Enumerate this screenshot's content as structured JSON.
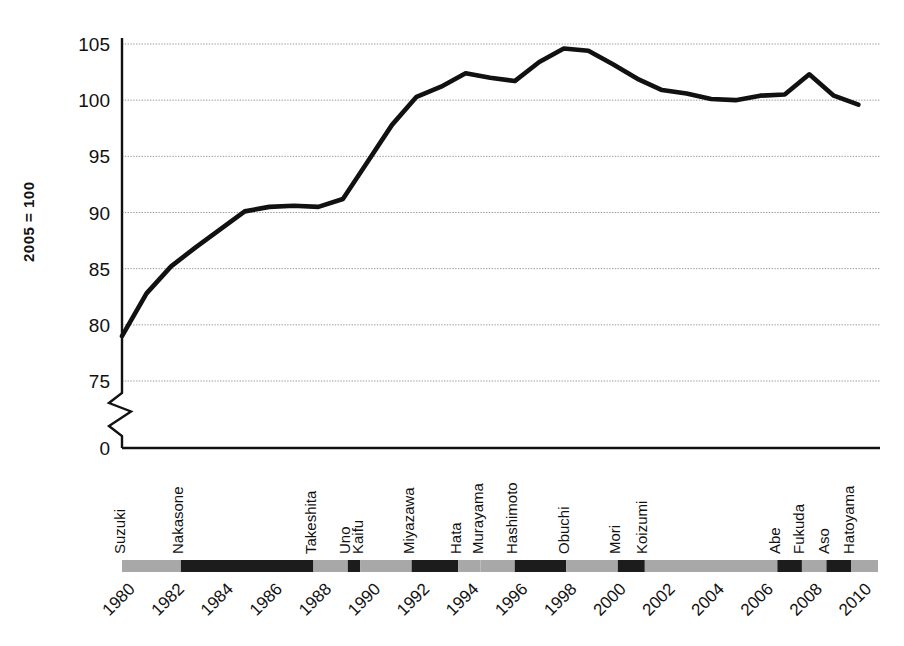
{
  "chart_data": {
    "type": "line",
    "title": "",
    "subtitle": "",
    "xlabel": "",
    "ylabel": "2005 = 100",
    "ylim": [
      75,
      105
    ],
    "y_axis_break": true,
    "y_axis_break_labels": [
      "0",
      "75"
    ],
    "grid": true,
    "legend": "none",
    "yticks": [
      0,
      75,
      80,
      85,
      90,
      95,
      100,
      105
    ],
    "ytick_labels": [
      "0",
      "75",
      "80",
      "85",
      "90",
      "95",
      "100",
      "105"
    ],
    "xticks": [
      1980,
      1982,
      1984,
      1986,
      1988,
      1990,
      1992,
      1994,
      1996,
      1998,
      2000,
      2002,
      2004,
      2006,
      2008,
      2010
    ],
    "xtick_labels": [
      "1980",
      "1982",
      "1984",
      "1986",
      "1988",
      "1990",
      "1992",
      "1994",
      "1996",
      "1998",
      "2000",
      "2002",
      "2004",
      "2006",
      "2008",
      "2010"
    ],
    "xlim": [
      1980,
      2010.8
    ],
    "series": [
      {
        "name": "Index (2005 = 100)",
        "x": [
          1980,
          1981,
          1982,
          1983,
          1984,
          1985,
          1986,
          1987,
          1988,
          1989,
          1990,
          1991,
          1992,
          1993,
          1994,
          1995,
          1996,
          1997,
          1998,
          1999,
          2000,
          2001,
          2002,
          2003,
          2004,
          2005,
          2006,
          2007,
          2008,
          2009,
          2010
        ],
        "values": [
          79.0,
          82.8,
          85.2,
          86.9,
          88.5,
          90.1,
          90.5,
          90.6,
          90.5,
          91.2,
          94.5,
          97.8,
          100.3,
          101.2,
          102.4,
          102.0,
          101.7,
          103.4,
          104.6,
          104.4,
          103.2,
          101.9,
          100.9,
          100.6,
          100.1,
          100.0,
          100.4,
          100.5,
          102.3,
          100.4,
          99.6
        ]
      }
    ],
    "annotations": []
  },
  "axis": {
    "y_label": "2005 = 100",
    "y_ticks": [
      "105",
      "100",
      "95",
      "90",
      "85",
      "80",
      "75",
      "0"
    ],
    "x_ticks": [
      "1980",
      "1982",
      "1984",
      "1986",
      "1988",
      "1990",
      "1992",
      "1994",
      "1996",
      "1998",
      "2000",
      "2002",
      "2004",
      "2006",
      "2008",
      "2010"
    ]
  },
  "prime_ministers": {
    "caption": "Japanese Prime Ministers timeline",
    "entries": [
      {
        "name": "Suzuki",
        "start": 1980.0,
        "end": 1982.4,
        "shade": "light"
      },
      {
        "name": "Nakasone",
        "start": 1982.4,
        "end": 1987.8,
        "shade": "dark"
      },
      {
        "name": "Takeshita",
        "start": 1987.8,
        "end": 1989.2,
        "shade": "light"
      },
      {
        "name": "Uno",
        "start": 1989.2,
        "end": 1989.7,
        "shade": "dark"
      },
      {
        "name": "Kaifu",
        "start": 1989.7,
        "end": 1991.8,
        "shade": "light"
      },
      {
        "name": "Miyazawa",
        "start": 1991.8,
        "end": 1993.7,
        "shade": "dark"
      },
      {
        "name": "Hata",
        "start": 1993.7,
        "end": 1994.6,
        "shade": "light"
      },
      {
        "name": "Murayama",
        "start": 1994.6,
        "end": 1996.0,
        "shade": "light"
      },
      {
        "name": "Hashimoto",
        "start": 1996.0,
        "end": 1998.1,
        "shade": "dark"
      },
      {
        "name": "Obuchi",
        "start": 1998.1,
        "end": 2000.2,
        "shade": "light"
      },
      {
        "name": "Mori",
        "start": 2000.2,
        "end": 2001.3,
        "shade": "dark"
      },
      {
        "name": "Koizumi",
        "start": 2001.3,
        "end": 2006.7,
        "shade": "light"
      },
      {
        "name": "Abe",
        "start": 2006.7,
        "end": 2007.7,
        "shade": "dark"
      },
      {
        "name": "Fukuda",
        "start": 2007.7,
        "end": 2008.7,
        "shade": "light"
      },
      {
        "name": "Aso",
        "start": 2008.7,
        "end": 2009.7,
        "shade": "dark"
      },
      {
        "name": "Hatoyama",
        "start": 2009.7,
        "end": 2010.8,
        "shade": "light"
      }
    ]
  },
  "colors": {
    "line": "#111111",
    "grid": "#9a9a9a",
    "axis": "#111111",
    "bar_light": "#a8a8a8",
    "bar_dark": "#1c1c1c",
    "background": "#ffffff"
  }
}
